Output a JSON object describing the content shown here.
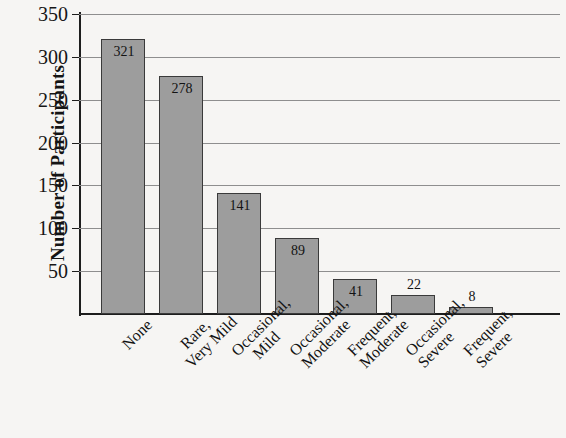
{
  "chart_data": {
    "type": "bar",
    "title": "",
    "xlabel": "",
    "ylabel": "Number of Participants",
    "categories": [
      "None",
      "Rare, Very Mild",
      "Occasional, Mild",
      "Occasional, Moderate",
      "Frequent, Moderate",
      "Occasional, Severe",
      "Frequent, Severe"
    ],
    "category_lines": [
      [
        "None"
      ],
      [
        "Rare,",
        "Very Mild"
      ],
      [
        "Occasional,",
        "Mild"
      ],
      [
        "Occasional,",
        "Moderate"
      ],
      [
        "Frequent,",
        "Moderate"
      ],
      [
        "Occasional,",
        "Severe"
      ],
      [
        "Frequent,",
        "Severe"
      ]
    ],
    "values": [
      321,
      278,
      141,
      89,
      41,
      22,
      8
    ],
    "data_labels": [
      "321",
      "278",
      "141",
      "89",
      "41",
      "22",
      "8"
    ],
    "label_placement": [
      "inside",
      "inside",
      "inside",
      "inside",
      "inside",
      "outside",
      "outside"
    ],
    "ylim": [
      0,
      350
    ],
    "yticks": [
      50,
      100,
      150,
      200,
      250,
      300,
      350
    ],
    "ytick_labels": [
      "50",
      "100",
      "150",
      "200",
      "250",
      "300",
      "350"
    ],
    "grid": true,
    "legend": false,
    "bar_color": "#9d9d9d",
    "bar_border_color": "#3a3a3a",
    "gridline_color": "#8e8e8e",
    "axis_color": "#1d1d1d",
    "background_color": "#f6f5f3",
    "text_color": "#141414"
  }
}
